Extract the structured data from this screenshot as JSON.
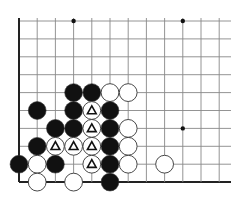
{
  "diagram": {
    "type": "go-board-fragment",
    "grid": {
      "origin_x": 19,
      "origin_y": 21,
      "spacing_x": 18.2,
      "spacing_y": 17.9,
      "columns": 12,
      "rows": 10,
      "right_extent": 231,
      "line_color": "#888888",
      "edge_color": "#222222",
      "edges": [
        "left",
        "bottom"
      ]
    },
    "star_points": [
      {
        "col": 3,
        "row": 0
      },
      {
        "col": 9,
        "row": 0
      },
      {
        "col": 9,
        "row": 6
      }
    ],
    "stones": [
      {
        "col": 3,
        "row": 4,
        "color": "black"
      },
      {
        "col": 4,
        "row": 4,
        "color": "black"
      },
      {
        "col": 5,
        "row": 4,
        "color": "white"
      },
      {
        "col": 6,
        "row": 4,
        "color": "white"
      },
      {
        "col": 1,
        "row": 5,
        "color": "black"
      },
      {
        "col": 3,
        "row": 5,
        "color": "black"
      },
      {
        "col": 4,
        "row": 5,
        "color": "white",
        "mark": "triangle"
      },
      {
        "col": 5,
        "row": 5,
        "color": "black"
      },
      {
        "col": 2,
        "row": 6,
        "color": "black"
      },
      {
        "col": 3,
        "row": 6,
        "color": "black"
      },
      {
        "col": 4,
        "row": 6,
        "color": "white",
        "mark": "triangle"
      },
      {
        "col": 5,
        "row": 6,
        "color": "black"
      },
      {
        "col": 6,
        "row": 6,
        "color": "white"
      },
      {
        "col": 1,
        "row": 7,
        "color": "black"
      },
      {
        "col": 2,
        "row": 7,
        "color": "white",
        "mark": "triangle"
      },
      {
        "col": 3,
        "row": 7,
        "color": "white",
        "mark": "triangle"
      },
      {
        "col": 4,
        "row": 7,
        "color": "white",
        "mark": "triangle"
      },
      {
        "col": 5,
        "row": 7,
        "color": "black"
      },
      {
        "col": 6,
        "row": 7,
        "color": "white"
      },
      {
        "col": 0,
        "row": 8,
        "color": "black"
      },
      {
        "col": 1,
        "row": 8,
        "color": "white"
      },
      {
        "col": 2,
        "row": 8,
        "color": "black"
      },
      {
        "col": 4,
        "row": 8,
        "color": "white",
        "mark": "triangle"
      },
      {
        "col": 5,
        "row": 8,
        "color": "black"
      },
      {
        "col": 6,
        "row": 8,
        "color": "white"
      },
      {
        "col": 8,
        "row": 8,
        "color": "white"
      },
      {
        "col": 1,
        "row": 9,
        "color": "white"
      },
      {
        "col": 3,
        "row": 9,
        "color": "white"
      },
      {
        "col": 5,
        "row": 9,
        "color": "black"
      }
    ],
    "colors": {
      "black_stone": "#111111",
      "white_stone": "#ffffff",
      "stone_outline": "#333333",
      "mark": "#111111"
    }
  }
}
